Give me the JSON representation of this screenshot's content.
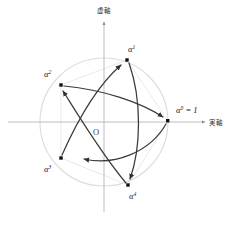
{
  "figure": {
    "title": "",
    "origin_label": "O",
    "axes": {
      "imaginary": {
        "label": "虚軸",
        "name": "imaginary-axis"
      },
      "real": {
        "label": "実軸",
        "name": "real-axis"
      }
    },
    "unit_circle": {
      "center": [
        104,
        122
      ],
      "radius": 64,
      "color": "#d8d8d8"
    },
    "points": [
      {
        "id": "a0",
        "label": "α",
        "exponent": "0",
        "suffix": " = 1",
        "x": 168,
        "y": 121,
        "angle_deg": 0,
        "label_x": 176,
        "label_y": 113
      },
      {
        "id": "a1",
        "label": "α",
        "exponent": "1",
        "suffix": "",
        "x": 127,
        "y": 60,
        "angle_deg": 72,
        "label_x": 128,
        "label_y": 52
      },
      {
        "id": "a2",
        "label": "α",
        "exponent": "2",
        "suffix": "",
        "x": 61,
        "y": 85,
        "angle_deg": 144,
        "label_x": 44,
        "label_y": 77
      },
      {
        "id": "a3",
        "label": "α",
        "exponent": "3",
        "suffix": "",
        "x": 61,
        "y": 158,
        "angle_deg": 216,
        "label_x": 44,
        "label_y": 172
      },
      {
        "id": "a4",
        "label": "α",
        "exponent": "4",
        "suffix": "",
        "x": 128,
        "y": 185,
        "angle_deg": 288,
        "label_x": 129,
        "label_y": 199
      }
    ],
    "arrows": [
      {
        "from": "a0",
        "to": "a3",
        "name": "arrow-a0-a3"
      },
      {
        "from": "a3",
        "to": "a1",
        "name": "arrow-a3-a1"
      },
      {
        "from": "a1",
        "to": "a4",
        "name": "arrow-a1-a4"
      },
      {
        "from": "a4",
        "to": "a2",
        "name": "arrow-a4-a2"
      },
      {
        "from": "a2",
        "to": "a0",
        "name": "arrow-a2-a0"
      }
    ],
    "colors": {
      "axis": "#b0b0b0",
      "circle": "#dcdcdc",
      "arc": "#3a3a3a",
      "point": "#111111",
      "text": "#1a1a1a"
    }
  }
}
